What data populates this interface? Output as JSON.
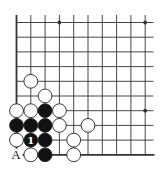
{
  "diagram": {
    "type": "go-board-fragment",
    "corner": "lower-left",
    "grid": {
      "cols": 10,
      "rows": 10,
      "x0": 16.5,
      "y0": 22.5,
      "dx": 14.3,
      "dy": 14.7,
      "right_extend": 153.5,
      "top_extend": 15
    },
    "colors": {
      "line": "#333333",
      "black_stone": "#111111",
      "white_stone": "#ffffff",
      "stone_outline": "#222222",
      "label_on_black": "#ffffff",
      "label_text": "#222222"
    },
    "star_points": [
      {
        "col": 3,
        "row": 0
      },
      {
        "col": 9,
        "row": 0
      },
      {
        "col": 9,
        "row": 6
      }
    ],
    "stones": [
      {
        "color": "white",
        "col": 1,
        "row": 4
      },
      {
        "color": "white",
        "col": 2,
        "row": 5
      },
      {
        "color": "white",
        "col": 0,
        "row": 6
      },
      {
        "color": "white",
        "col": 1,
        "row": 6
      },
      {
        "color": "black",
        "col": 2,
        "row": 6
      },
      {
        "color": "white",
        "col": 3,
        "row": 6
      },
      {
        "color": "black",
        "col": 0,
        "row": 7
      },
      {
        "color": "black",
        "col": 1,
        "row": 7
      },
      {
        "color": "black",
        "col": 2,
        "row": 7
      },
      {
        "color": "white",
        "col": 3,
        "row": 7
      },
      {
        "color": "white",
        "col": 5,
        "row": 7
      },
      {
        "color": "white",
        "col": 0,
        "row": 8
      },
      {
        "color": "black",
        "col": 1,
        "row": 8,
        "label": "1"
      },
      {
        "color": "black",
        "col": 2,
        "row": 8
      },
      {
        "color": "white",
        "col": 4,
        "row": 8
      },
      {
        "color": "white",
        "col": 1,
        "row": 9
      },
      {
        "color": "black",
        "col": 2,
        "row": 9
      },
      {
        "color": "white",
        "col": 4,
        "row": 9
      }
    ],
    "point_labels": [
      {
        "text": "A",
        "col": 0,
        "row": 9
      }
    ]
  }
}
